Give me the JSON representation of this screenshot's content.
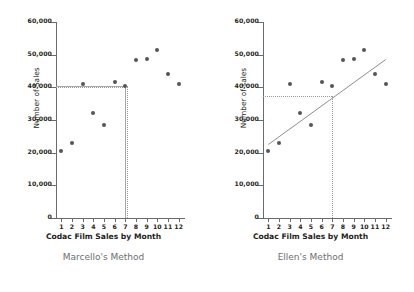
{
  "figure": {
    "background": "#ffffff",
    "point_color": "#555557",
    "axis_color": "#6b6b6b",
    "guide_color": "#9a9a9c",
    "caption_color": "#6d6e71"
  },
  "chart_data": [
    {
      "type": "scatter",
      "title": "Marcello's Method",
      "xlabel": "Codac Film Sales by Month",
      "ylabel": "Number of Sales",
      "x": [
        1,
        2,
        3,
        4,
        5,
        6,
        7,
        8,
        9,
        10,
        11,
        12
      ],
      "categories": [
        "1",
        "2",
        "3",
        "4",
        "5",
        "6",
        "7",
        "8",
        "9",
        "10",
        "11",
        "12"
      ],
      "values": [
        20500,
        23000,
        41000,
        32000,
        28500,
        41500,
        40500,
        48500,
        48800,
        51500,
        44000,
        41000
      ],
      "xlim": [
        0.5,
        12.5
      ],
      "ylim": [
        0,
        60000
      ],
      "yticks": [
        0,
        10000,
        20000,
        30000,
        40000,
        50000,
        60000
      ],
      "ytick_labels": [
        "0",
        "10,000",
        "20,000",
        "30,000",
        "40,000",
        "50,000",
        "60,000"
      ],
      "grid": false,
      "legend": "none",
      "annotations": {
        "type": "flat-guide",
        "prediction_value": 40500,
        "prediction_x": 7,
        "horizontal_guide": "solid line at y=40,500 from y-axis to x=7",
        "vertical_guide": "dotted line at x=7 from y=40,500 down to x-axis"
      }
    },
    {
      "type": "scatter",
      "title": "Ellen's Method",
      "xlabel": "Codac Film Sales by Month",
      "ylabel": "Number of sales",
      "x": [
        1,
        2,
        3,
        4,
        5,
        6,
        7,
        8,
        9,
        10,
        11,
        12
      ],
      "categories": [
        "1",
        "2",
        "3",
        "4",
        "5",
        "6",
        "7",
        "8",
        "9",
        "10",
        "11",
        "12"
      ],
      "values": [
        20500,
        23000,
        41000,
        32000,
        28500,
        41500,
        40500,
        48500,
        48800,
        51500,
        44000,
        41000
      ],
      "xlim": [
        0.5,
        12.5
      ],
      "ylim": [
        0,
        60000
      ],
      "yticks": [
        0,
        10000,
        20000,
        30000,
        40000,
        50000,
        60000
      ],
      "ytick_labels": [
        "0",
        "10,000",
        "20,000",
        "30,000",
        "40,000",
        "50,000",
        "60,000"
      ],
      "grid": false,
      "legend": "none",
      "trendline": {
        "from": [
          1,
          22500
        ],
        "to": [
          12,
          48500
        ]
      },
      "annotations": {
        "type": "trendline-guide",
        "prediction_value": 37500,
        "prediction_x": 7,
        "horizontal_guide": "dotted line at y=37,500 from y-axis to x=7",
        "vertical_guide": "dotted line at x=7 from y=37,500 down to x-axis"
      }
    }
  ]
}
